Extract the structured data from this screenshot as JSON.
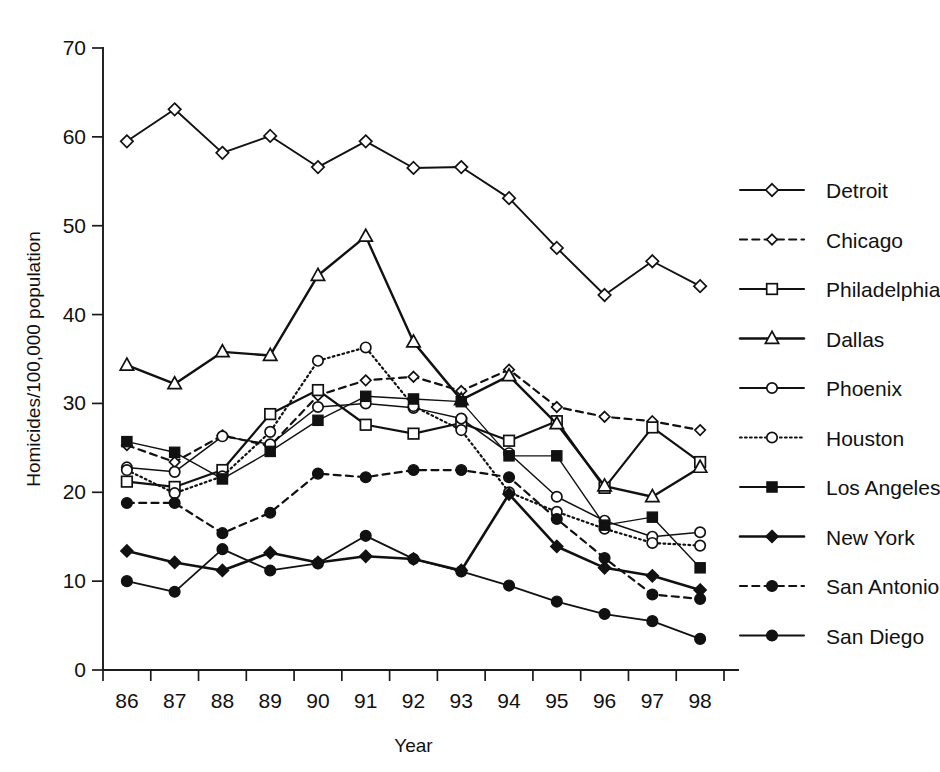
{
  "chart_data": {
    "type": "line",
    "title": "",
    "xlabel": "Year",
    "ylabel": "Homicides/100,000 population",
    "categories": [
      "86",
      "87",
      "88",
      "89",
      "90",
      "91",
      "92",
      "93",
      "94",
      "95",
      "96",
      "97",
      "98"
    ],
    "x": [
      1986,
      1987,
      1988,
      1989,
      1990,
      1991,
      1992,
      1993,
      1994,
      1995,
      1996,
      1997,
      1998
    ],
    "xlim": [
      1985.5,
      1998.5
    ],
    "ylim": [
      0,
      70
    ],
    "yticks": [
      0,
      10,
      20,
      30,
      40,
      50,
      60,
      70
    ],
    "grid": false,
    "legend_position": "right",
    "legend_clipped": true,
    "series": [
      {
        "name": "Detroit",
        "marker": "diamond-open",
        "linestyle": "solid",
        "linewidth": 1.9,
        "values": [
          59.5,
          63.1,
          58.2,
          60.1,
          56.6,
          59.5,
          56.5,
          56.6,
          53.1,
          47.5,
          42.2,
          46.0,
          43.2
        ]
      },
      {
        "name": "Chicago",
        "marker": "diamond-open-small",
        "linestyle": "dashed",
        "linewidth": 2.2,
        "values": [
          25.3,
          23.4,
          26.4,
          25.2,
          30.9,
          32.6,
          33.0,
          31.4,
          33.8,
          29.6,
          28.5,
          28.0,
          27.0
        ]
      },
      {
        "name": "Philadelphia",
        "marker": "square-open",
        "linestyle": "solid",
        "linewidth": 2.2,
        "values": [
          21.2,
          20.6,
          22.5,
          28.8,
          31.5,
          27.6,
          26.6,
          27.8,
          25.8,
          28.0,
          20.5,
          27.3,
          23.4
        ]
      },
      {
        "name": "Dallas",
        "marker": "triangle-open",
        "linestyle": "solid",
        "linewidth": 2.4,
        "values": [
          34.3,
          32.2,
          35.8,
          35.4,
          44.4,
          48.8,
          36.9,
          30.4,
          33.1,
          27.7,
          20.7,
          19.5,
          22.8
        ]
      },
      {
        "name": "Phoenix",
        "marker": "circle-open",
        "linestyle": "solid",
        "linewidth": 1.5,
        "values": [
          22.8,
          22.3,
          26.3,
          25.4,
          29.6,
          30.0,
          29.5,
          28.3,
          24.4,
          19.5,
          16.8,
          15.0,
          15.5
        ]
      },
      {
        "name": "Houston",
        "marker": "circle-open",
        "linestyle": "dotted",
        "linewidth": 2.2,
        "values": [
          22.5,
          19.9,
          21.8,
          26.8,
          34.8,
          36.3,
          29.7,
          27.0,
          20.0,
          17.8,
          15.9,
          14.3,
          14.0
        ]
      },
      {
        "name": "Los Angeles",
        "marker": "square-filled",
        "linestyle": "solid",
        "linewidth": 1.4,
        "values": [
          25.7,
          24.5,
          21.5,
          24.6,
          28.1,
          30.8,
          30.5,
          30.2,
          24.1,
          24.1,
          16.3,
          17.2,
          11.5
        ]
      },
      {
        "name": "New York",
        "marker": "diamond-filled",
        "linestyle": "solid",
        "linewidth": 2.6,
        "values": [
          13.4,
          12.1,
          11.2,
          13.2,
          12.1,
          12.8,
          12.5,
          11.2,
          19.8,
          13.9,
          11.5,
          10.6,
          9.0
        ]
      },
      {
        "name": "San Antonio",
        "marker": "circle-filled",
        "linestyle": "dashed",
        "linewidth": 2.2,
        "values": [
          18.8,
          18.8,
          15.4,
          17.7,
          22.1,
          21.7,
          22.5,
          22.5,
          21.7,
          17.0,
          12.6,
          8.5,
          8.0
        ]
      },
      {
        "name": "San Diego",
        "marker": "circle-filled",
        "linestyle": "solid",
        "linewidth": 1.8,
        "values": [
          10.0,
          8.8,
          13.6,
          11.2,
          12.0,
          15.1,
          12.5,
          11.1,
          9.5,
          7.7,
          6.3,
          5.5,
          3.5
        ]
      }
    ]
  },
  "legend": {
    "entries": [
      {
        "label": "Detroit"
      },
      {
        "label": "Chicago"
      },
      {
        "label": "Philadelphia"
      },
      {
        "label": "Dallas"
      },
      {
        "label": "Phoenix"
      },
      {
        "label": "Houston"
      },
      {
        "label": "Los Angeles"
      },
      {
        "label": "New York"
      },
      {
        "label": "San Antonio"
      },
      {
        "label": "San Diego"
      }
    ]
  },
  "colors": {
    "ink": "#111111",
    "background": "#ffffff"
  }
}
